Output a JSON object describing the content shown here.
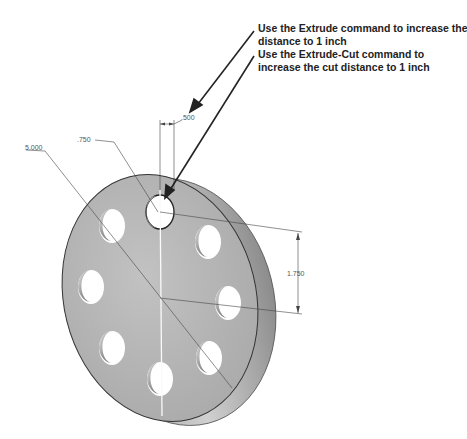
{
  "callouts": [
    {
      "line1": "Use the Extrude command to increase the",
      "line2": "distance to 1 inch"
    },
    {
      "line1": "Use the Extrude-Cut command to",
      "line2": "increase the cut distance to 1 inch"
    }
  ],
  "dimensions": {
    "outer_diameter": "5.000",
    "hole_diameter": ".750",
    "thickness": ".500",
    "bolt_circle_radius": "1.750"
  },
  "part": {
    "hole_count": 8,
    "face_color": "#b4b4b4",
    "edge_color": "#8a8a8a"
  }
}
